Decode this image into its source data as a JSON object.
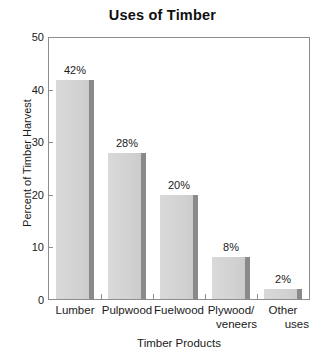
{
  "chart_data": {
    "type": "bar",
    "title": "Uses of Timber",
    "xlabel": "Timber Products",
    "ylabel": "Percent of Timber Harvest",
    "categories": [
      "Lumber",
      "Pulpwood",
      "Fuelwood",
      "Plywood/ veneers",
      "Other uses"
    ],
    "category_lines": [
      [
        "Lumber"
      ],
      [
        "Pulpwood"
      ],
      [
        "Fuelwood"
      ],
      [
        "Plywood/",
        "veneers"
      ],
      [
        "Other",
        "uses"
      ]
    ],
    "values": [
      42,
      28,
      20,
      8,
      2
    ],
    "value_labels": [
      "42%",
      "28%",
      "20%",
      "8%",
      "2%"
    ],
    "ylim": [
      0,
      50
    ],
    "yticks": [
      0,
      10,
      20,
      30,
      40,
      50
    ],
    "ytick_labels": [
      "0",
      "10",
      "20",
      "30",
      "40",
      "50"
    ],
    "grid": false,
    "legend": "none",
    "bar_fill_color": "#d3d3d3",
    "bar_shadow_color": "#8a8a8a",
    "frame_color": "#8d8d8d",
    "background_color": "#ffffff",
    "text_color": "#1a1a1a"
  }
}
